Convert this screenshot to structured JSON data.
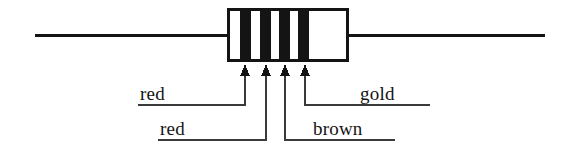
{
  "figure": {
    "type": "schematic-diagram",
    "background_color": "#ffffff",
    "ink_color": "#141414"
  },
  "resistor": {
    "body": {
      "x": 227,
      "y": 8,
      "width": 122,
      "height": 54,
      "fill": "#ffffff",
      "stroke": "#141414",
      "stroke_width": 3
    },
    "lead_left": {
      "x1": 35,
      "y1": 35,
      "x2": 227,
      "y2": 35
    },
    "lead_right": {
      "x1": 349,
      "y1": 35,
      "x2": 545,
      "y2": 35
    },
    "lead_stroke_width": 3,
    "band_count": 4,
    "bands": [
      {
        "index": 1,
        "name": "band-1",
        "color_name": "red",
        "x": 240,
        "width": 11,
        "fill": "#141414"
      },
      {
        "index": 2,
        "name": "band-2",
        "color_name": "red",
        "x": 260,
        "width": 11,
        "fill": "#141414"
      },
      {
        "index": 3,
        "name": "band-3",
        "color_name": "brown",
        "x": 279,
        "width": 11,
        "fill": "#141414"
      },
      {
        "index": 4,
        "name": "band-4",
        "color_name": "gold",
        "x": 298,
        "width": 11,
        "fill": "#141414"
      }
    ]
  },
  "callouts": [
    {
      "id": "red-1",
      "label": "red",
      "band_index": 1,
      "arrow_x": 245,
      "arrow_tip_y": 66,
      "elbow_y": 105,
      "underline_x1": 138,
      "underline_x2": 245,
      "label_x": 140,
      "label_y": 84
    },
    {
      "id": "red-2",
      "label": "red",
      "band_index": 2,
      "arrow_x": 266,
      "arrow_tip_y": 66,
      "elbow_y": 140,
      "underline_x1": 158,
      "underline_x2": 266,
      "label_x": 160,
      "label_y": 119
    },
    {
      "id": "brown",
      "label": "brown",
      "band_index": 3,
      "arrow_x": 285,
      "arrow_tip_y": 66,
      "elbow_y": 140,
      "underline_x1": 285,
      "underline_x2": 395,
      "label_x": 313,
      "label_y": 119
    },
    {
      "id": "gold",
      "label": "gold",
      "band_index": 4,
      "arrow_x": 305,
      "arrow_tip_y": 66,
      "elbow_y": 105,
      "underline_x1": 305,
      "underline_x2": 430,
      "label_x": 360,
      "label_y": 84
    }
  ],
  "labels": {
    "red_1": "red",
    "red_2": "red",
    "brown": "brown",
    "gold": "gold"
  }
}
